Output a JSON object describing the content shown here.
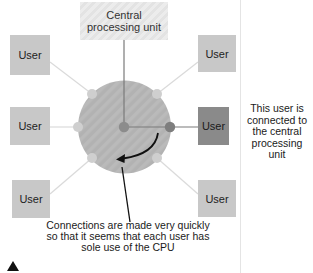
{
  "diagram": {
    "cpu_label": "Central processing unit",
    "users": [
      {
        "id": "top-left",
        "label": "User",
        "active": false
      },
      {
        "id": "middle-left",
        "label": "User",
        "active": false
      },
      {
        "id": "bottom-left",
        "label": "User",
        "active": false
      },
      {
        "id": "top-right",
        "label": "User",
        "active": false
      },
      {
        "id": "middle-right",
        "label": "User",
        "active": true
      },
      {
        "id": "bottom-right",
        "label": "User",
        "active": false
      }
    ],
    "side_note": "This user is connected to the central processing unit",
    "caption": "Connections are made very quickly so that it seems that each user has sole use of the CPU",
    "colors": {
      "user_box": "#c8c8c8",
      "active_user_box": "#8a8a8a",
      "circle": "#b4b4b4",
      "connector_light": "#d8d8d8",
      "connector_dark": "#7a7a7a"
    }
  }
}
